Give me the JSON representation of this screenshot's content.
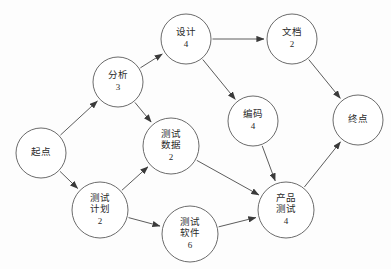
{
  "diagram": {
    "type": "activity-network-diagram",
    "width": 391,
    "height": 269,
    "background_color": "#fdfdfd",
    "node_fill": "#ffffff",
    "node_stroke": "#5a5a5a",
    "edge_color": "#4a4a4a",
    "text_color": "#2a2a2a",
    "node_radius": 25,
    "nodes": [
      {
        "id": "start",
        "label": "起点",
        "weight": "",
        "cx": 41,
        "cy": 153,
        "r": 25,
        "lines": [
          "起点"
        ]
      },
      {
        "id": "analysis",
        "label": "分析",
        "weight": "3",
        "cx": 118,
        "cy": 82,
        "r": 25,
        "lines": [
          "分析"
        ]
      },
      {
        "id": "design",
        "label": "设计",
        "weight": "4",
        "cx": 186,
        "cy": 39,
        "r": 25,
        "lines": [
          "设计"
        ]
      },
      {
        "id": "document",
        "label": "文档",
        "weight": "2",
        "cx": 292,
        "cy": 39,
        "r": 25,
        "lines": [
          "文档"
        ]
      },
      {
        "id": "coding",
        "label": "编码",
        "weight": "4",
        "cx": 253,
        "cy": 121,
        "r": 25,
        "lines": [
          "编码"
        ]
      },
      {
        "id": "testdata",
        "label": "测试数据",
        "weight": "2",
        "cx": 171,
        "cy": 146,
        "r": 28,
        "lines": [
          "测试",
          "数据"
        ]
      },
      {
        "id": "testplan",
        "label": "测试计划",
        "weight": "2",
        "cx": 100,
        "cy": 210,
        "r": 28,
        "lines": [
          "测试",
          "计划"
        ]
      },
      {
        "id": "testsoft",
        "label": "测试软件",
        "weight": "6",
        "cx": 190,
        "cy": 234,
        "r": 28,
        "lines": [
          "测试",
          "软件"
        ]
      },
      {
        "id": "prodtest",
        "label": "产品测试",
        "weight": "4",
        "cx": 286,
        "cy": 210,
        "r": 28,
        "lines": [
          "产品",
          "测试"
        ]
      },
      {
        "id": "end",
        "label": "终点",
        "weight": "",
        "cx": 358,
        "cy": 120,
        "r": 25,
        "lines": [
          "终点"
        ]
      }
    ],
    "edges": [
      {
        "from": "start",
        "to": "analysis",
        "arrow": true
      },
      {
        "from": "start",
        "to": "testplan",
        "arrow": true
      },
      {
        "from": "analysis",
        "to": "design",
        "arrow": true
      },
      {
        "from": "analysis",
        "to": "testdata",
        "arrow": true
      },
      {
        "from": "design",
        "to": "document",
        "arrow": true
      },
      {
        "from": "design",
        "to": "coding",
        "arrow": true
      },
      {
        "from": "document",
        "to": "end",
        "arrow": true
      },
      {
        "from": "coding",
        "to": "prodtest",
        "arrow": true
      },
      {
        "from": "testdata",
        "to": "prodtest",
        "arrow": true
      },
      {
        "from": "testplan",
        "to": "testdata",
        "arrow": true
      },
      {
        "from": "testplan",
        "to": "testsoft",
        "arrow": true
      },
      {
        "from": "testsoft",
        "to": "prodtest",
        "arrow": true
      },
      {
        "from": "prodtest",
        "to": "end",
        "arrow": true
      }
    ]
  }
}
